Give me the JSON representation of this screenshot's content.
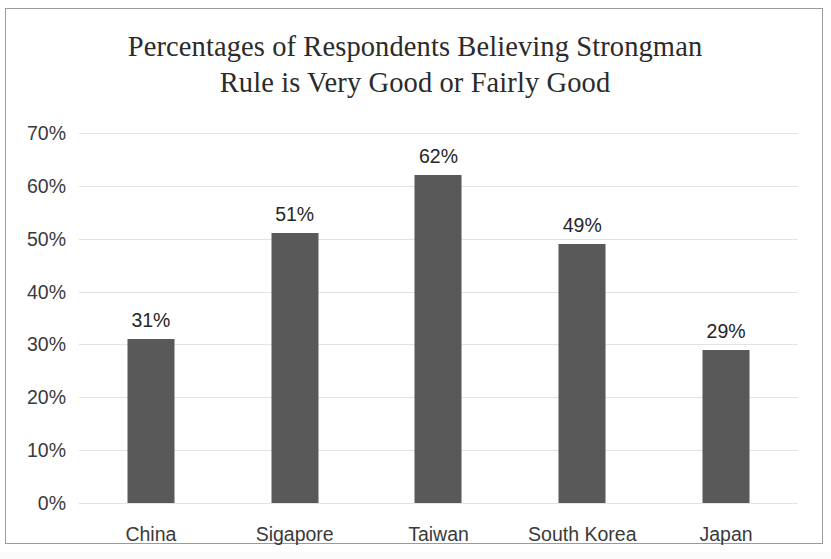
{
  "chart_data": {
    "type": "bar",
    "title": "Percentages of Respondents Believing Strongman\nRule is Very Good or Fairly Good",
    "title_line_1": "Percentages of Respondents Believing Strongman",
    "title_line_2": "Rule is Very Good or Fairly Good",
    "categories": [
      "China",
      "Sigapore",
      "Taiwan",
      "South Korea",
      "Japan"
    ],
    "values": [
      31,
      51,
      62,
      49,
      29
    ],
    "data_labels": [
      "31%",
      "51%",
      "62%",
      "49%",
      "29%"
    ],
    "xlabel": "",
    "ylabel": "",
    "ylim": [
      0,
      70
    ],
    "ytick_values": [
      70,
      60,
      50,
      40,
      30,
      20,
      10,
      0
    ],
    "ytick_labels": [
      "70%",
      "60%",
      "50%",
      "40%",
      "30%",
      "20%",
      "10%",
      "0%"
    ],
    "grid": true,
    "legend": false,
    "bar_color": "#595959",
    "gridline_color": "#e3e3e3",
    "text_color": "#3a3a3a",
    "border_color": "#9a9a9a"
  }
}
